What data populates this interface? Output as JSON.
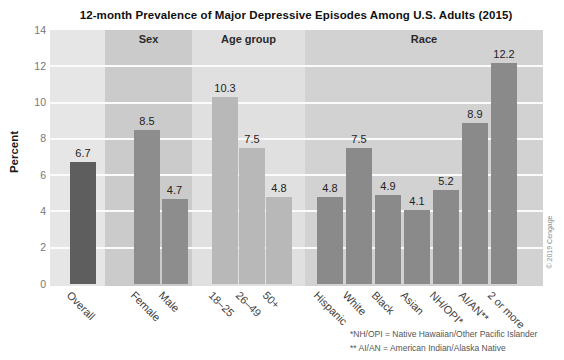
{
  "title": "12-month Prevalence of Major Depressive Episodes Among U.S. Adults (2015)",
  "chart_data": {
    "type": "bar",
    "title": "12-month Prevalence of Major Depressive Episodes Among U.S. Adults (2015)",
    "ylabel": "Percent",
    "xlabel": "",
    "ylim": [
      0,
      14
    ],
    "yticks": [
      0,
      2,
      4,
      6,
      8,
      10,
      12,
      14
    ],
    "grid": "horizontal-white-gridlines",
    "legend": "none",
    "groups": [
      {
        "name": "",
        "bar_color": "#5e5e5e",
        "panel_color": "#e6e6e6",
        "bars": [
          {
            "label": "Overall",
            "value": 6.7
          }
        ]
      },
      {
        "name": "Sex",
        "bar_color": "#8d8d8d",
        "panel_color": "#cbcbcb",
        "bars": [
          {
            "label": "Female",
            "value": 8.5
          },
          {
            "label": "Male",
            "value": 4.7
          }
        ]
      },
      {
        "name": "Age group",
        "bar_color": "#b8b8b8",
        "panel_color": "#e0e0e0",
        "bars": [
          {
            "label": "18–25",
            "value": 10.3
          },
          {
            "label": "26–49",
            "value": 7.5
          },
          {
            "label": "50+",
            "value": 4.8
          }
        ]
      },
      {
        "name": "Race",
        "bar_color": "#8a8a8a",
        "panel_color": "#d2d2d2",
        "bars": [
          {
            "label": "Hispanic",
            "value": 4.8
          },
          {
            "label": "White",
            "value": 7.5
          },
          {
            "label": "Black",
            "value": 4.9
          },
          {
            "label": "Asian",
            "value": 4.1
          },
          {
            "label": "NH/OPI*",
            "value": 5.2
          },
          {
            "label": "AI/AN**",
            "value": 8.9
          },
          {
            "label": "2 or more",
            "value": 12.2
          }
        ]
      }
    ],
    "footnotes": [
      "*NH/OPI = Native Hawaiian/Other Pacific Islander",
      "** AI/AN = American Indian/Alaska Native"
    ],
    "copyright": "© 2019 Cengage"
  }
}
